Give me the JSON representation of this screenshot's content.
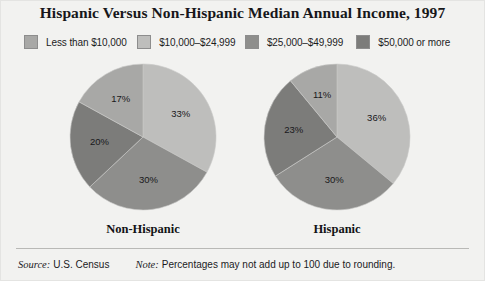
{
  "title": "Hispanic Versus Non-Hispanic Median Annual Income, 1997",
  "legend": {
    "items": [
      {
        "label": "Less than $10,000",
        "color": "#a8a8a6"
      },
      {
        "label": "$10,000–$24,999",
        "color": "#bebebc"
      },
      {
        "label": "$25,000–$49,999",
        "color": "#8e8e8c"
      },
      {
        "label": "$50,000 or more",
        "color": "#7c7c7a"
      }
    ]
  },
  "footer": {
    "source_key": "Source:",
    "source_value": "U.S. Census",
    "note_key": "Note:",
    "note_value": "Percentages may not add up to 100 due to rounding."
  },
  "chart_data": {
    "type": "pie",
    "title": "Hispanic Versus Non-Hispanic Median Annual Income, 1997",
    "legend_position": "top",
    "categories": [
      "Less than $10,000",
      "$10,000–$24,999",
      "$25,000–$49,999",
      "$50,000 or more"
    ],
    "colors": [
      "#a8a8a6",
      "#bebebc",
      "#8e8e8c",
      "#7c7c7a"
    ],
    "unit": "percent",
    "charts": [
      {
        "name": "Non-Hispanic",
        "caption": "Non-Hispanic",
        "slices": [
          {
            "category": "$10,000–$24,999",
            "value": 33,
            "label": "33%",
            "color": "#bebebc"
          },
          {
            "category": "$25,000–$49,999",
            "value": 30,
            "label": "30%",
            "color": "#8e8e8c"
          },
          {
            "category": "$50,000 or more",
            "value": 20,
            "label": "20%",
            "color": "#7c7c7a"
          },
          {
            "category": "Less than $10,000",
            "value": 17,
            "label": "17%",
            "color": "#a8a8a6"
          }
        ]
      },
      {
        "name": "Hispanic",
        "caption": "Hispanic",
        "slices": [
          {
            "category": "$10,000–$24,999",
            "value": 36,
            "label": "36%",
            "color": "#bebebc"
          },
          {
            "category": "$25,000–$49,999",
            "value": 30,
            "label": "30%",
            "color": "#8e8e8c"
          },
          {
            "category": "$50,000 or more",
            "value": 23,
            "label": "23%",
            "color": "#7c7c7a"
          },
          {
            "category": "Less than $10,000",
            "value": 11,
            "label": "11%",
            "color": "#a8a8a6"
          }
        ]
      }
    ]
  }
}
